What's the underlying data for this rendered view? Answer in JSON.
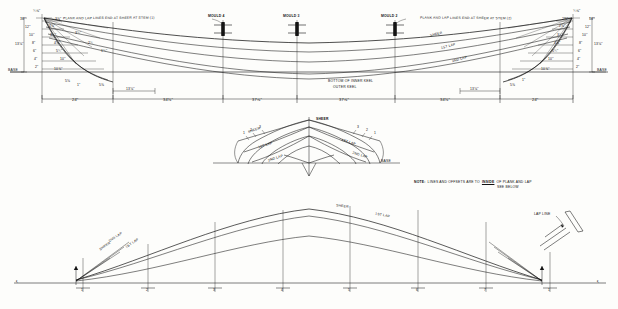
{
  "drawing": {
    "type": "boat-lines-plan",
    "views": [
      {
        "name": "sheer-profile-plan",
        "position": "top"
      },
      {
        "name": "body-plan",
        "position": "middle"
      },
      {
        "name": "half-breadth-plan",
        "position": "bottom"
      }
    ]
  },
  "profile": {
    "top_note_left": "PLANK AND LAP LINES END AT SHEER AT STEM (1)",
    "mould_labels": [
      {
        "id": "mould-4",
        "text": "MOULD 4",
        "x": 223,
        "y": 17
      },
      {
        "id": "mould-3",
        "text": "MOULD 3",
        "x": 297,
        "y": 17
      },
      {
        "id": "mould-2",
        "text": "MOULD 2",
        "x": 395,
        "y": 17
      }
    ],
    "top_note_right": "PLANK AND LAP LINES END AT SHEER AT STEM (2)",
    "curve_labels": [
      {
        "text": "SHEER",
        "x": 430,
        "y": 36
      },
      {
        "text": "1ST LAP",
        "x": 444,
        "y": 47
      },
      {
        "text": "2ND LAP",
        "x": 455,
        "y": 60
      }
    ],
    "keel_labels": [
      {
        "text": "BOTTOM OF INNER KEEL",
        "x": 330,
        "y": 82
      },
      {
        "text": "OUTER KEEL",
        "x": 335,
        "y": 88
      }
    ],
    "base_label": "BASE",
    "height_dim": "13⅛\"",
    "dimensions": [
      {
        "text": "24\"",
        "x": 78,
        "y": 100
      },
      {
        "text": "34⅛\"",
        "x": 172,
        "y": 100
      },
      {
        "text": "37⅝\"",
        "x": 258,
        "y": 100
      },
      {
        "text": "37⅝\"",
        "x": 360,
        "y": 100
      },
      {
        "text": "34⅛\"",
        "x": 446,
        "y": 100
      },
      {
        "text": "24\"",
        "x": 540,
        "y": 100
      }
    ],
    "small_dims_left": [
      {
        "text": "13⅛\"",
        "x": 120,
        "y": 92
      },
      {
        "text": "5⅜",
        "x": 101,
        "y": 86
      }
    ],
    "small_dims_right": [
      {
        "text": "13⅛\"",
        "x": 487,
        "y": 92
      },
      {
        "text": "5⅜",
        "x": 513,
        "y": 86
      },
      {
        "text": "1\"",
        "x": 524,
        "y": 82
      }
    ],
    "left_stem_offsets": [
      {
        "text": "¾⅝\"",
        "x": 36,
        "y": 12
      },
      {
        "text": "14\"",
        "x": 22,
        "y": 20
      },
      {
        "text": "12\"",
        "x": 27,
        "y": 28
      },
      {
        "text": "10\"",
        "x": 31,
        "y": 36
      },
      {
        "text": "8\"",
        "x": 34,
        "y": 44
      },
      {
        "text": "6\"",
        "x": 35,
        "y": 52
      },
      {
        "text": "4\"",
        "x": 36,
        "y": 60
      },
      {
        "text": "2\"",
        "x": 37,
        "y": 68
      },
      {
        "text": "2⅜\"",
        "x": 51,
        "y": 27
      },
      {
        "text": "3½\"",
        "x": 52,
        "y": 36
      },
      {
        "text": "4⅛\"",
        "x": 56,
        "y": 44
      },
      {
        "text": "5¾\"",
        "x": 58,
        "y": 52
      },
      {
        "text": "10\"",
        "x": 62,
        "y": 60
      },
      {
        "text": "10⅜\"",
        "x": 56,
        "y": 70
      },
      {
        "text": "5⅛",
        "x": 67,
        "y": 82
      },
      {
        "text": "1\"",
        "x": 79,
        "y": 86
      },
      {
        "text": "3¾\"",
        "x": 77,
        "y": 34
      },
      {
        "text": "2¾",
        "x": 90,
        "y": 44
      },
      {
        "text": "1¾\"",
        "x": 103,
        "y": 52
      },
      {
        "text": "3⅜\"",
        "x": 57,
        "y": 20
      }
    ],
    "right_stem_offsets": [
      {
        "text": "¾⅝\"",
        "x": 578,
        "y": 12
      },
      {
        "text": "14\"",
        "x": 592,
        "y": 20
      },
      {
        "text": "12\"",
        "x": 588,
        "y": 28
      },
      {
        "text": "10\"",
        "x": 585,
        "y": 36
      },
      {
        "text": "8\"",
        "x": 582,
        "y": 44
      },
      {
        "text": "6\"",
        "x": 581,
        "y": 52
      },
      {
        "text": "4\"",
        "x": 580,
        "y": 60
      },
      {
        "text": "2\"",
        "x": 579,
        "y": 68
      },
      {
        "text": "2⅜\"",
        "x": 563,
        "y": 27
      },
      {
        "text": "3½\"",
        "x": 561,
        "y": 36
      },
      {
        "text": "4⅛\"",
        "x": 558,
        "y": 44
      },
      {
        "text": "5¾\"",
        "x": 556,
        "y": 52
      },
      {
        "text": "10\"",
        "x": 552,
        "y": 60
      },
      {
        "text": "10⅜\"",
        "x": 545,
        "y": 70
      },
      {
        "text": "2⅜\"",
        "x": 566,
        "y": 20
      }
    ]
  },
  "body_plan": {
    "center_label": "SHEER",
    "labels": [
      {
        "text": "SHEER",
        "x": 253,
        "y": 131
      },
      {
        "text": "1ST LAP",
        "x": 262,
        "y": 146
      },
      {
        "text": "2ND LAP",
        "x": 272,
        "y": 159
      },
      {
        "text": "SHEER",
        "x": 322,
        "y": 122
      },
      {
        "text": "1ST LAP",
        "x": 345,
        "y": 143
      },
      {
        "text": "2ND LAP",
        "x": 356,
        "y": 156
      },
      {
        "text": "BASE",
        "x": 382,
        "y": 162
      }
    ],
    "station_numbers_left": [
      "1",
      "2",
      "3"
    ],
    "station_numbers_right": [
      "1",
      "2",
      "3"
    ]
  },
  "note": {
    "prefix": "NOTE:",
    "line1_a": "LINES AND OFFSETS ARE TO ",
    "line1_emph": "INSIDE",
    "line1_b": " OF PLANK AND LAP",
    "line2": "SEE BELOW"
  },
  "lap_detail": {
    "label": "LAP LINE"
  },
  "half_breadth": {
    "labels": [
      {
        "text": "SHEER",
        "x": 340,
        "y": 207
      },
      {
        "text": "1ST LAP",
        "x": 378,
        "y": 216
      },
      {
        "text": "2ND LAP",
        "x": 112,
        "y": 237
      },
      {
        "text": "1ST LAP",
        "x": 128,
        "y": 244
      },
      {
        "text": "SHEER",
        "x": 103,
        "y": 246
      }
    ],
    "centerline_label": "℄",
    "stations": [
      {
        "label": "1",
        "x": 83
      },
      {
        "label": "2",
        "x": 148
      },
      {
        "label": "3",
        "x": 215
      },
      {
        "label": "4",
        "x": 283
      },
      {
        "label": "5",
        "x": 350
      },
      {
        "label": "6",
        "x": 418
      },
      {
        "label": "7",
        "x": 486
      },
      {
        "label": "1",
        "x": 550
      }
    ],
    "stem_marks": [
      {
        "text": "℄",
        "x": 18,
        "y": 285
      },
      {
        "text": "℄",
        "x": 598,
        "y": 285
      }
    ]
  },
  "colors": {
    "ink": "#121212",
    "paper": "#fdfdfb",
    "faint": "#3a3a3a"
  }
}
